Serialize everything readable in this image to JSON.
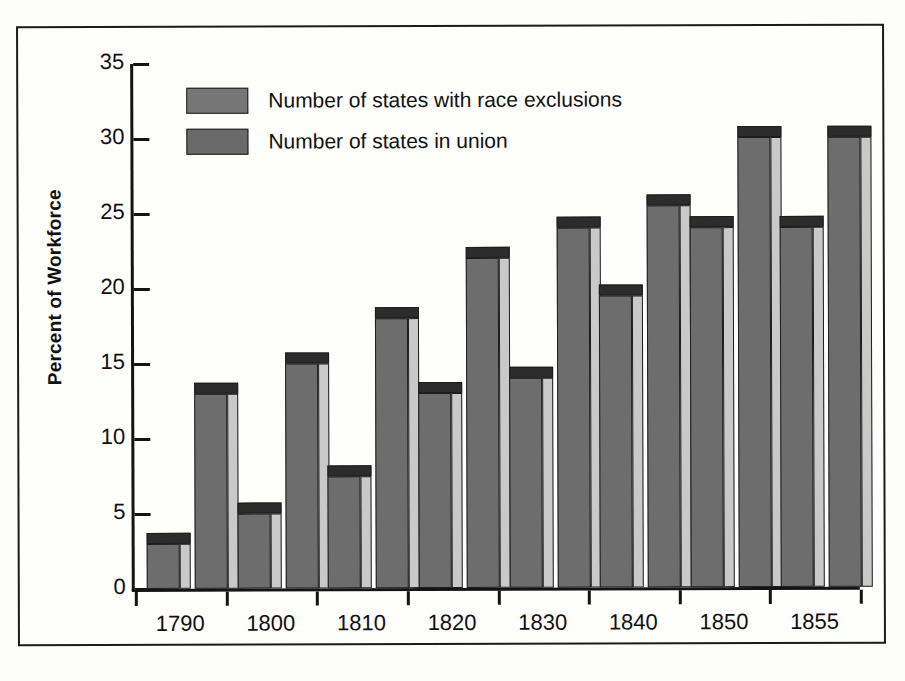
{
  "figure": {
    "y_axis_title": "Percent of Workforce"
  },
  "legend": {
    "items": [
      {
        "label": "Number of states with race exclusions",
        "color": "#767676"
      },
      {
        "label": "Number of states in union",
        "color": "#6a6a6a"
      }
    ]
  },
  "chart_data": {
    "type": "bar",
    "title": "",
    "xlabel": "",
    "ylabel": "Percent of Workforce",
    "ylim": [
      0,
      35
    ],
    "yticks": [
      0,
      5,
      10,
      15,
      20,
      25,
      30,
      35
    ],
    "ytick_labels": [
      "0",
      "5",
      "10",
      "15",
      "20",
      "25",
      "30",
      "35"
    ],
    "grid": false,
    "legend_position": "top-left-inside",
    "categories": [
      "1790",
      "1800",
      "1810",
      "1820",
      "1830",
      "1840",
      "1850",
      "1855"
    ],
    "series": [
      {
        "name": "Number of states with race exclusions",
        "color": "#6d6d6d",
        "values": [
          3,
          5,
          7.5,
          13,
          14,
          19.5,
          24,
          24
        ]
      },
      {
        "name": "Number of states in union",
        "color": "#6d6d6d",
        "values": [
          13,
          15,
          18,
          22,
          24,
          25.5,
          30,
          30
        ]
      }
    ]
  }
}
